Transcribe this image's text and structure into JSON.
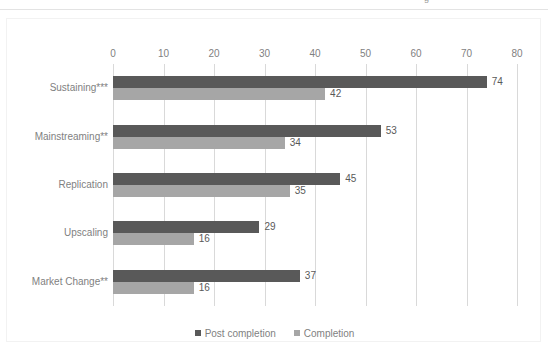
{
  "top_artifact": {
    "text_fragment": "g"
  },
  "legend": {
    "position": "bottom",
    "items": [
      {
        "label": "Post completion",
        "color": "#595959"
      },
      {
        "label": "Completion",
        "color": "#a6a6a6"
      }
    ]
  },
  "axis": {
    "tick_labels": [
      "0",
      "10",
      "20",
      "30",
      "40",
      "50",
      "60",
      "70",
      "80"
    ]
  },
  "chart_data": {
    "type": "bar",
    "orientation": "horizontal",
    "title": "",
    "subtitle": "",
    "xlabel": "",
    "ylabel": "",
    "xlim": [
      0,
      80
    ],
    "xticks": [
      0,
      10,
      20,
      30,
      40,
      50,
      60,
      70,
      80
    ],
    "grid": true,
    "grid_axis": "x",
    "legend_position": "bottom",
    "categories": [
      "Sustaining***",
      "Mainstreaming**",
      "Replication",
      "Upscaling",
      "Market Change**"
    ],
    "series": [
      {
        "name": "Post completion",
        "color": "#595959",
        "values": [
          74,
          53,
          45,
          29,
          37
        ]
      },
      {
        "name": "Completion",
        "color": "#a6a6a6",
        "values": [
          42,
          34,
          35,
          16,
          16
        ]
      }
    ],
    "data_labels": {
      "Post completion": [
        "74",
        "53",
        "45",
        "29",
        "37"
      ],
      "Completion": [
        "42",
        "34",
        "35",
        "16",
        "16"
      ]
    }
  }
}
